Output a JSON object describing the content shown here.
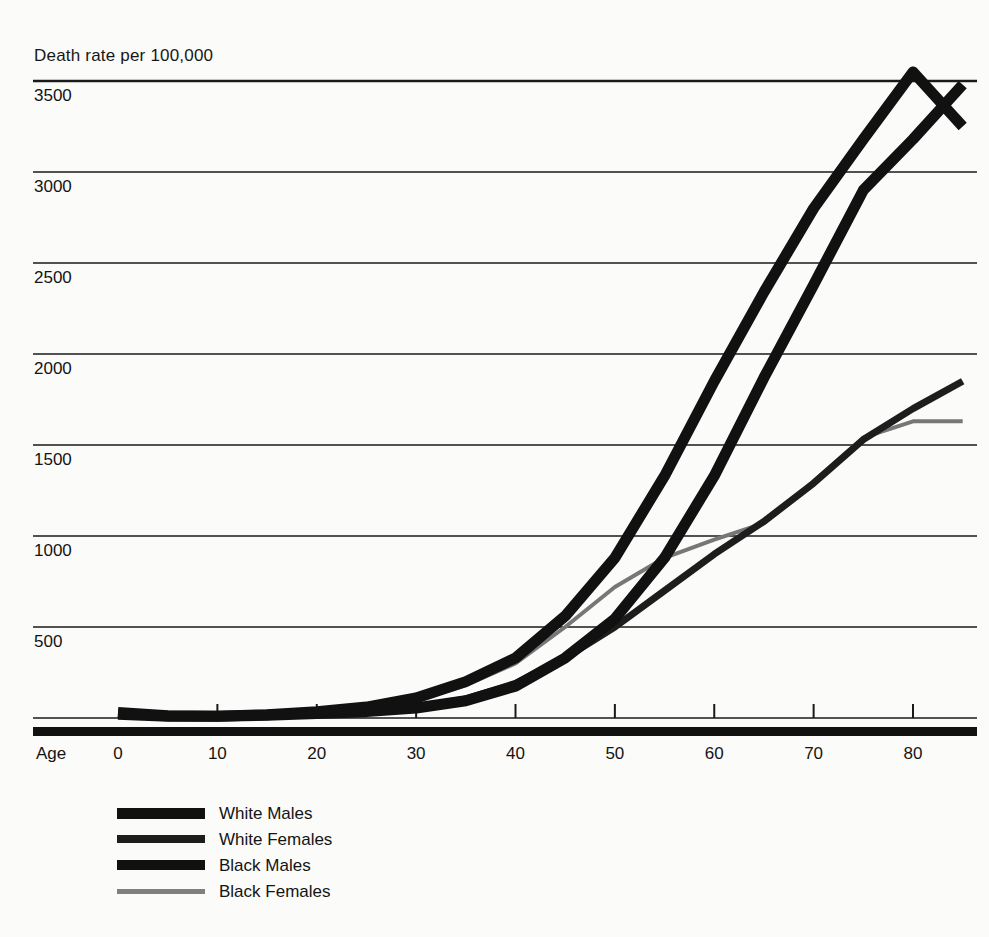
{
  "chart_data": {
    "type": "line",
    "title": "",
    "ylabel": "Death rate per 100,000",
    "xlabel": "Age",
    "ylim": [
      0,
      3700
    ],
    "xlim": [
      0,
      85
    ],
    "grid": true,
    "legend_position": "bottom-left",
    "y_ticks": [
      3500,
      3000,
      2500,
      2000,
      1500,
      1000,
      500
    ],
    "x_ticks": [
      0,
      10,
      20,
      30,
      40,
      50,
      60,
      70,
      80
    ],
    "x": [
      0,
      5,
      10,
      15,
      20,
      25,
      30,
      35,
      40,
      45,
      50,
      55,
      60,
      65,
      70,
      75,
      80,
      85
    ],
    "series": [
      {
        "name": "White Males",
        "color": "#111111",
        "width": 11,
        "values": [
          20,
          10,
          10,
          15,
          25,
          35,
          55,
          95,
          175,
          330,
          545,
          880,
          1330,
          1870,
          2380,
          2900,
          3180,
          3480
        ]
      },
      {
        "name": "White Females",
        "color": "#1d1d1d",
        "width": 7,
        "values": [
          18,
          8,
          8,
          12,
          22,
          35,
          60,
          105,
          190,
          330,
          500,
          700,
          900,
          1080,
          1290,
          1530,
          1700,
          1850
        ]
      },
      {
        "name": "Black Males",
        "color": "#111111",
        "width": 11,
        "values": [
          30,
          12,
          10,
          18,
          35,
          60,
          110,
          200,
          330,
          560,
          880,
          1330,
          1850,
          2340,
          2800,
          3180,
          3550,
          3250
        ]
      },
      {
        "name": "Black Females",
        "color": "#777777",
        "width": 4,
        "values": [
          28,
          10,
          9,
          15,
          30,
          55,
          100,
          180,
          300,
          500,
          720,
          880,
          980,
          1070,
          1300,
          1540,
          1630,
          1630
        ]
      }
    ]
  },
  "axis": {
    "y_caption": "Death rate per 100,000",
    "x_title": "Age",
    "y_tick_labels": [
      "3500",
      "3000",
      "2500",
      "2000",
      "1500",
      "1000",
      "500"
    ],
    "x_tick_labels": [
      "0",
      "10",
      "20",
      "30",
      "40",
      "50",
      "60",
      "70",
      "80"
    ]
  },
  "legend": {
    "items": [
      {
        "label": "White Males",
        "color": "#111111",
        "thickness": 11
      },
      {
        "label": "White Females",
        "color": "#1d1d1d",
        "thickness": 8
      },
      {
        "label": "Black Males",
        "color": "#111111",
        "thickness": 10
      },
      {
        "label": "Black Females",
        "color": "#808080",
        "thickness": 5
      }
    ]
  }
}
